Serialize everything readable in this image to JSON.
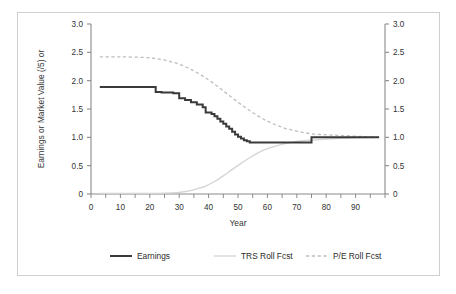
{
  "figure": {
    "background_color": "#ffffff",
    "border_color": "#cfcfcf"
  },
  "chart_data": {
    "type": "line",
    "title": "",
    "subtitle": "",
    "xlabel": "Year",
    "ylabel": "Earnings or Market Value (/5) or",
    "ylabel_right": "",
    "xlim": [
      0,
      100
    ],
    "ylim": [
      0,
      3.0
    ],
    "ylim_right": [
      0,
      3.0
    ],
    "grid": false,
    "legend_position": "bottom",
    "x_ticks": [
      0,
      10,
      20,
      30,
      40,
      50,
      60,
      70,
      80,
      90
    ],
    "x_tick_labels": [
      "0",
      "10",
      "20",
      "30",
      "40",
      "50",
      "60",
      "70",
      "80",
      "90"
    ],
    "x_minor_tick_step": 5,
    "y_ticks": [
      0,
      0.5,
      1.0,
      1.5,
      2.0,
      2.5,
      3.0
    ],
    "y_tick_labels": [
      "0",
      "0.5",
      "1.0",
      "1.5",
      "2.0",
      "2.5",
      "3.0"
    ],
    "y_ticks_right": [
      0,
      0.5,
      1.0,
      1.5,
      2.0,
      2.5,
      3.0
    ],
    "y_tick_labels_right": [
      "0",
      "0.5",
      "1.0",
      "1.5",
      "2.0",
      "2.5",
      "3.0"
    ],
    "series": [
      {
        "name": "Earnings",
        "color": "#3a3a3a",
        "style": "solid",
        "width": 2.0,
        "shape": "step",
        "x": [
          3,
          22,
          22,
          24,
          24,
          28,
          28,
          30,
          30,
          32,
          32,
          34,
          34,
          36,
          36,
          38,
          38,
          39,
          39,
          41,
          41,
          42,
          42,
          43,
          43,
          44,
          44,
          45,
          45,
          46,
          46,
          47,
          47,
          48,
          48,
          49,
          49,
          50,
          50,
          51,
          51,
          52,
          52,
          53,
          53,
          54,
          54,
          75,
          75,
          98
        ],
        "y": [
          1.89,
          1.89,
          1.8,
          1.8,
          1.79,
          1.79,
          1.78,
          1.78,
          1.69,
          1.69,
          1.66,
          1.66,
          1.62,
          1.62,
          1.58,
          1.58,
          1.53,
          1.53,
          1.44,
          1.44,
          1.41,
          1.41,
          1.37,
          1.37,
          1.33,
          1.33,
          1.28,
          1.28,
          1.24,
          1.24,
          1.19,
          1.19,
          1.15,
          1.15,
          1.1,
          1.1,
          1.05,
          1.05,
          1.01,
          1.01,
          0.98,
          0.98,
          0.95,
          0.95,
          0.93,
          0.93,
          0.91,
          0.91,
          1.0,
          1.0
        ]
      },
      {
        "name": "TRS Roll Fcst",
        "color": "#d4d4d4",
        "style": "solid",
        "width": 1.3,
        "shape": "smooth",
        "x": [
          3,
          10,
          20,
          25,
          30,
          33,
          36,
          39,
          42,
          45,
          48,
          51,
          54,
          57,
          60,
          63,
          66,
          69,
          72,
          75,
          80,
          85,
          90,
          98
        ],
        "y": [
          0.01,
          0.01,
          0.01,
          0.015,
          0.03,
          0.05,
          0.09,
          0.14,
          0.22,
          0.32,
          0.43,
          0.54,
          0.64,
          0.73,
          0.8,
          0.85,
          0.89,
          0.92,
          0.94,
          0.95,
          0.97,
          0.98,
          0.99,
          1.0
        ]
      },
      {
        "name": "P/E Roll Fcst",
        "color": "#bdbdbd",
        "style": "dashed",
        "width": 1.3,
        "shape": "smooth",
        "x": [
          3,
          10,
          18,
          22,
          26,
          30,
          34,
          38,
          42,
          46,
          50,
          54,
          58,
          62,
          66,
          70,
          74,
          78,
          82,
          86,
          90,
          94,
          98
        ],
        "y": [
          2.42,
          2.42,
          2.41,
          2.39,
          2.35,
          2.29,
          2.2,
          2.08,
          1.94,
          1.78,
          1.62,
          1.47,
          1.34,
          1.24,
          1.16,
          1.11,
          1.07,
          1.05,
          1.04,
          1.03,
          1.02,
          1.01,
          1.0
        ]
      }
    ]
  },
  "legend": {
    "items": [
      {
        "label": "Earnings",
        "color": "#3a3a3a",
        "style": "solid",
        "width": 2.0
      },
      {
        "label": "TRS Roll Fcst",
        "color": "#d4d4d4",
        "style": "solid",
        "width": 1.3
      },
      {
        "label": "P/E Roll Fcst",
        "color": "#bdbdbd",
        "style": "dashed",
        "width": 1.3
      }
    ]
  }
}
